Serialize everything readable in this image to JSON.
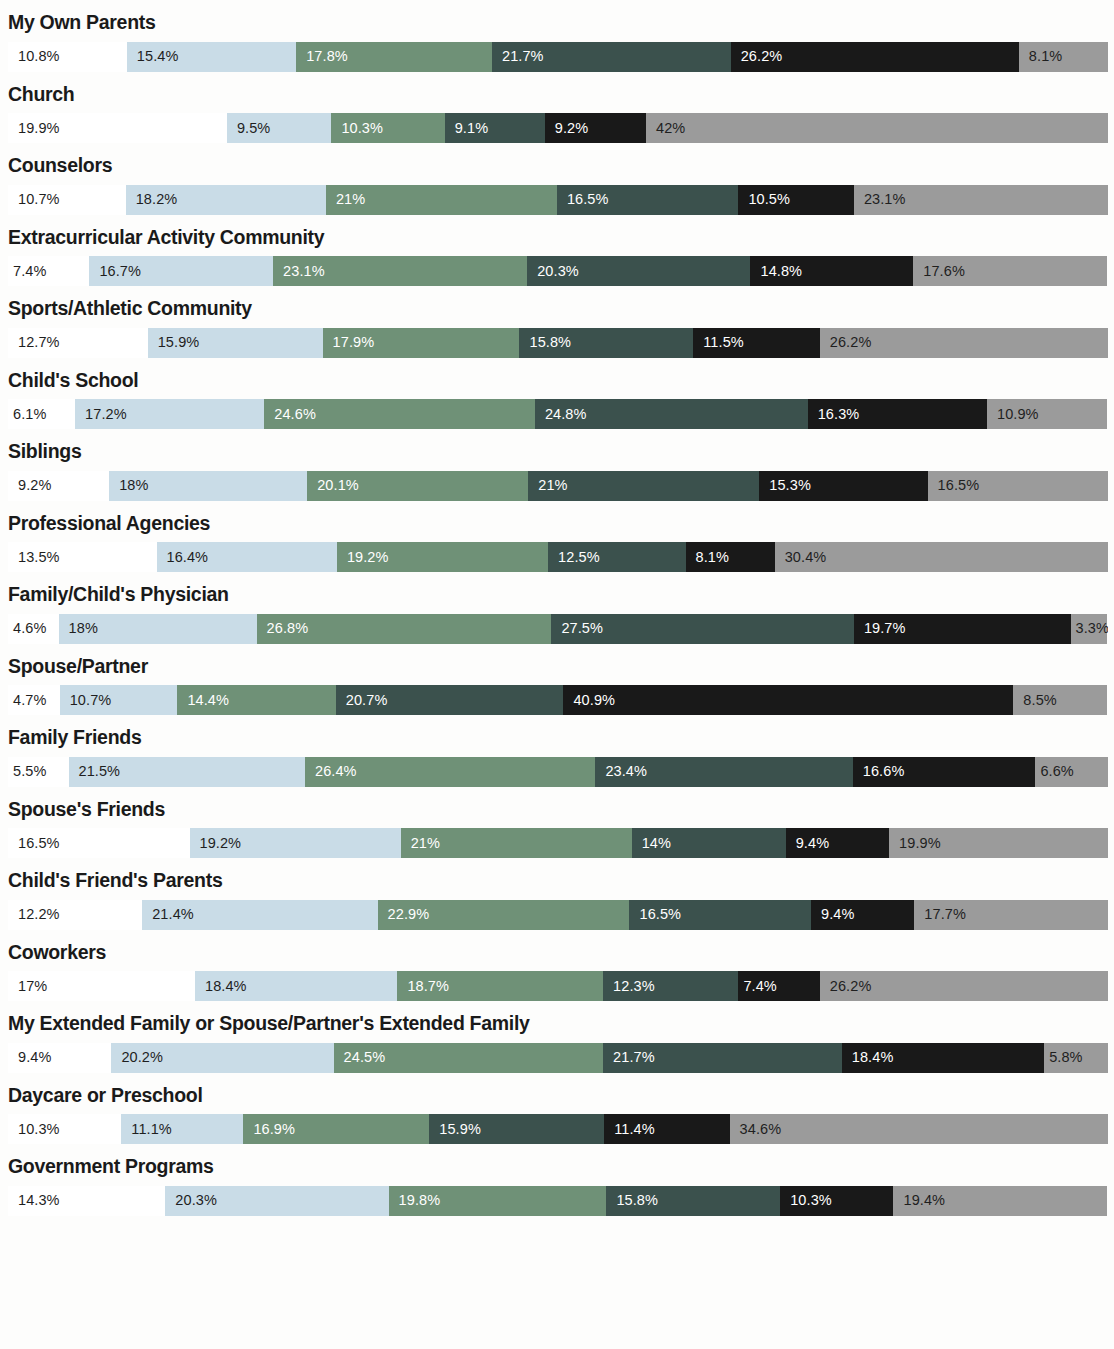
{
  "chart_data": {
    "type": "bar",
    "subtype": "stacked-horizontal-100-percent",
    "title": "",
    "subtitle": "",
    "xlabel": "",
    "ylabel": "",
    "xlim": [
      0,
      100
    ],
    "grid": false,
    "legend_position": "none",
    "value_suffix": "%",
    "series_colors": [
      "#ffffff",
      "#c9dce7",
      "#6f9177",
      "#3b514d",
      "#191919",
      "#9b9b9b"
    ],
    "series": [
      {
        "name": "segment-1",
        "color": "#ffffff",
        "values": [
          10.8,
          19.9,
          10.7,
          7.4,
          12.7,
          6.1,
          9.2,
          13.5,
          4.6,
          4.7,
          5.5,
          16.5,
          12.2,
          17,
          9.4,
          10.3,
          14.3
        ]
      },
      {
        "name": "segment-2",
        "color": "#c9dce7",
        "values": [
          15.4,
          9.5,
          18.2,
          16.7,
          15.9,
          17.2,
          18,
          16.4,
          18,
          10.7,
          21.5,
          19.2,
          21.4,
          18.4,
          20.2,
          11.1,
          20.3
        ]
      },
      {
        "name": "segment-3",
        "color": "#6f9177",
        "values": [
          17.8,
          10.3,
          21,
          23.1,
          17.9,
          24.6,
          20.1,
          19.2,
          26.8,
          14.4,
          26.4,
          21,
          22.9,
          18.7,
          24.5,
          16.9,
          19.8
        ]
      },
      {
        "name": "segment-4",
        "color": "#3b514d",
        "values": [
          21.7,
          9.1,
          16.5,
          20.3,
          15.8,
          24.8,
          21,
          12.5,
          27.5,
          20.7,
          23.4,
          14,
          16.5,
          12.3,
          21.7,
          15.9,
          15.8
        ]
      },
      {
        "name": "segment-5",
        "color": "#191919",
        "values": [
          26.2,
          9.2,
          10.5,
          14.8,
          11.5,
          16.3,
          15.3,
          8.1,
          19.7,
          40.9,
          16.6,
          9.4,
          9.4,
          7.4,
          18.4,
          11.4,
          10.3
        ]
      },
      {
        "name": "segment-6",
        "color": "#9b9b9b",
        "values": [
          8.1,
          42,
          23.1,
          17.6,
          26.2,
          10.9,
          16.5,
          30.4,
          3.3,
          8.5,
          6.6,
          19.9,
          17.7,
          26.2,
          5.8,
          34.6,
          19.4
        ]
      }
    ],
    "categories": [
      "My Own Parents",
      "Church",
      "Counselors",
      "Extracurricular Activity Community",
      "Sports/Athletic Community",
      "Child's School",
      "Siblings",
      "Professional Agencies",
      "Family/Child's Physician",
      "Spouse/Partner",
      "Family Friends",
      "Spouse's Friends",
      "Child's Friend's Parents",
      "Coworkers",
      "My Extended Family or Spouse/Partner's Extended Family",
      "Daycare or Preschool",
      "Government Programs"
    ],
    "rows": [
      {
        "label": "My Own Parents",
        "values": [
          10.8,
          15.4,
          17.8,
          21.7,
          26.2,
          8.1
        ],
        "labels": [
          "10.8%",
          "15.4%",
          "17.8%",
          "21.7%",
          "26.2%",
          "8.1%"
        ]
      },
      {
        "label": "Church",
        "values": [
          19.9,
          9.5,
          10.3,
          9.1,
          9.2,
          42
        ],
        "labels": [
          "19.9%",
          "9.5%",
          "10.3%",
          "9.1%",
          "9.2%",
          "42%"
        ]
      },
      {
        "label": "Counselors",
        "values": [
          10.7,
          18.2,
          21,
          16.5,
          10.5,
          23.1
        ],
        "labels": [
          "10.7%",
          "18.2%",
          "21%",
          "16.5%",
          "10.5%",
          "23.1%"
        ]
      },
      {
        "label": "Extracurricular Activity Community",
        "values": [
          7.4,
          16.7,
          23.1,
          20.3,
          14.8,
          17.6
        ],
        "labels": [
          "7.4%",
          "16.7%",
          "23.1%",
          "20.3%",
          "14.8%",
          "17.6%"
        ]
      },
      {
        "label": "Sports/Athletic Community",
        "values": [
          12.7,
          15.9,
          17.9,
          15.8,
          11.5,
          26.2
        ],
        "labels": [
          "12.7%",
          "15.9%",
          "17.9%",
          "15.8%",
          "11.5%",
          "26.2%"
        ]
      },
      {
        "label": "Child's School",
        "values": [
          6.1,
          17.2,
          24.6,
          24.8,
          16.3,
          10.9
        ],
        "labels": [
          "6.1%",
          "17.2%",
          "24.6%",
          "24.8%",
          "16.3%",
          "10.9%"
        ]
      },
      {
        "label": "Siblings",
        "values": [
          9.2,
          18,
          20.1,
          21,
          15.3,
          16.5
        ],
        "labels": [
          "9.2%",
          "18%",
          "20.1%",
          "21%",
          "15.3%",
          "16.5%"
        ]
      },
      {
        "label": "Professional Agencies",
        "values": [
          13.5,
          16.4,
          19.2,
          12.5,
          8.1,
          30.4
        ],
        "labels": [
          "13.5%",
          "16.4%",
          "19.2%",
          "12.5%",
          "8.1%",
          "30.4%"
        ]
      },
      {
        "label": "Family/Child's Physician",
        "values": [
          4.6,
          18,
          26.8,
          27.5,
          19.7,
          3.3
        ],
        "labels": [
          "4.6%",
          "18%",
          "26.8%",
          "27.5%",
          "19.7%",
          "3.3%"
        ]
      },
      {
        "label": "Spouse/Partner",
        "values": [
          4.7,
          10.7,
          14.4,
          20.7,
          40.9,
          8.5
        ],
        "labels": [
          "4.7%",
          "10.7%",
          "14.4%",
          "20.7%",
          "40.9%",
          "8.5%"
        ]
      },
      {
        "label": "Family Friends",
        "values": [
          5.5,
          21.5,
          26.4,
          23.4,
          16.6,
          6.6
        ],
        "labels": [
          "5.5%",
          "21.5%",
          "26.4%",
          "23.4%",
          "16.6%",
          "6.6%"
        ]
      },
      {
        "label": "Spouse's Friends",
        "values": [
          16.5,
          19.2,
          21,
          14,
          9.4,
          19.9
        ],
        "labels": [
          "16.5%",
          "19.2%",
          "21%",
          "14%",
          "9.4%",
          "19.9%"
        ]
      },
      {
        "label": "Child's Friend's Parents",
        "values": [
          12.2,
          21.4,
          22.9,
          16.5,
          9.4,
          17.7
        ],
        "labels": [
          "12.2%",
          "21.4%",
          "22.9%",
          "16.5%",
          "9.4%",
          "17.7%"
        ]
      },
      {
        "label": "Coworkers",
        "values": [
          17,
          18.4,
          18.7,
          12.3,
          7.4,
          26.2
        ],
        "labels": [
          "17%",
          "18.4%",
          "18.7%",
          "12.3%",
          "7.4%",
          "26.2%"
        ]
      },
      {
        "label": "My Extended Family or Spouse/Partner's Extended Family",
        "values": [
          9.4,
          20.2,
          24.5,
          21.7,
          18.4,
          5.8
        ],
        "labels": [
          "9.4%",
          "20.2%",
          "24.5%",
          "21.7%",
          "18.4%",
          "5.8%"
        ]
      },
      {
        "label": "Daycare or Preschool",
        "values": [
          10.3,
          11.1,
          16.9,
          15.9,
          11.4,
          34.6
        ],
        "labels": [
          "10.3%",
          "11.1%",
          "16.9%",
          "15.9%",
          "11.4%",
          "34.6%"
        ]
      },
      {
        "label": "Government Programs",
        "values": [
          14.3,
          20.3,
          19.8,
          15.8,
          10.3,
          19.4
        ],
        "labels": [
          "14.3%",
          "20.3%",
          "19.8%",
          "15.8%",
          "10.3%",
          "19.4%"
        ]
      }
    ]
  }
}
